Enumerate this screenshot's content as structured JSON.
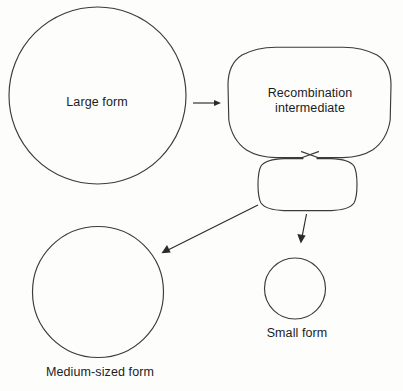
{
  "figure": {
    "background_color": "#fdfdfc",
    "stroke_color": "#3b3b3b",
    "text_color": "#1c1c1c"
  },
  "labels": {
    "large_form": "Large form",
    "recombination_intermediate_line1": "Recombination",
    "recombination_intermediate_line2": "intermediate",
    "medium_form": "Medium-sized form",
    "small_form": "Small form"
  },
  "nodes": [
    {
      "id": "large-form",
      "shape": "circle",
      "label": "Large form",
      "cx": 97.5,
      "cy": 95.5,
      "r": 88.5,
      "label_x": 97,
      "label_y": 102
    },
    {
      "id": "recombination-intermediate-large-loop",
      "shape": "rounded-rectangle",
      "label": "Recombination intermediate",
      "x": 228,
      "y": 47,
      "width": 163,
      "height": 111,
      "corner_radius": 48,
      "label_x": 310,
      "label_y": 101
    },
    {
      "id": "recombination-intermediate-small-loop",
      "shape": "rounded-rectangle",
      "label": "",
      "x": 258,
      "y": 158,
      "width": 99,
      "height": 53,
      "corner_radius": 26,
      "label_x": 0,
      "label_y": 0
    },
    {
      "id": "medium-form",
      "shape": "circle",
      "label": "Medium-sized form",
      "cx": 98,
      "cy": 292,
      "r": 65.5,
      "label_x": 100,
      "label_y": 372
    },
    {
      "id": "small-form",
      "shape": "circle",
      "label": "Small form",
      "cx": 295,
      "cy": 288.5,
      "r": 30.5,
      "label_x": 297,
      "label_y": 333
    }
  ],
  "arrows": [
    {
      "id": "large-to-intermediate",
      "from": "large-form",
      "to": "recombination-intermediate-large-loop",
      "x1": 193,
      "y1": 103,
      "x2": 219,
      "y2": 103,
      "direction": "right"
    },
    {
      "id": "intermediate-to-medium",
      "from": "recombination-intermediate-small-loop",
      "to": "medium-form",
      "x1": 258,
      "y1": 205,
      "x2": 162,
      "y2": 253,
      "direction": "down-left"
    },
    {
      "id": "intermediate-to-small",
      "from": "recombination-intermediate-small-loop",
      "to": "small-form",
      "x1": 306,
      "y1": 214,
      "x2": 301,
      "y2": 243,
      "direction": "down"
    }
  ],
  "crossover": {
    "id": "strand-crossover",
    "center_x": 310,
    "center_y": 155,
    "description": "X-shaped strand exchange joining the two loops"
  }
}
